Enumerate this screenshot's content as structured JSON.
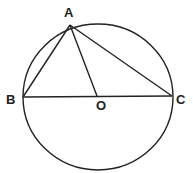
{
  "diagram": {
    "type": "circle-geometry",
    "circle": {
      "center": "O",
      "cx": 98,
      "cy": 97,
      "rx": 75,
      "ry": 73
    },
    "points": {
      "A": {
        "label": "A",
        "x": 70,
        "y": 25,
        "label_x": 64,
        "label_y": 17
      },
      "B": {
        "label": "B",
        "x": 23,
        "y": 97,
        "label_x": 6,
        "label_y": 104
      },
      "O": {
        "label": "O",
        "x": 97,
        "y": 96,
        "label_x": 96,
        "label_y": 110
      },
      "C": {
        "label": "C",
        "x": 172,
        "y": 96,
        "label_x": 176,
        "label_y": 104
      }
    },
    "segments": [
      [
        "A",
        "B"
      ],
      [
        "A",
        "O"
      ],
      [
        "A",
        "C"
      ],
      [
        "B",
        "C"
      ]
    ],
    "stroke_color": "#222222"
  }
}
